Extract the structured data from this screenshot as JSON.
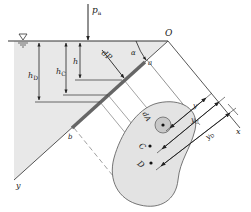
{
  "diagram": {
    "type": "hydrostatic-pressure-on-inclined-plane",
    "labels": {
      "atm_pressure": "p",
      "atm_pressure_sub": "a",
      "origin": "O",
      "angle": "α",
      "point_a": "a",
      "point_b": "b",
      "force_element": "dP",
      "depth_h": "h",
      "depth_hC": "h",
      "depth_hC_sub": "C",
      "depth_hD": "h",
      "depth_hD_sub": "D",
      "axis_x": "x",
      "axis_y": "y",
      "area_element": "dA",
      "centroid": "C",
      "pressure_center": "D",
      "dist_y": "y",
      "dist_yC": "y",
      "dist_yC_sub": "C",
      "dist_yD": "y",
      "dist_yD_sub": "D"
    },
    "colors": {
      "water_fill": "#e6e6e6",
      "plate_fill": "#e3e3e3",
      "plate_edge": "#555555",
      "line": "#333333",
      "thick_plate": "#666666",
      "dA_fill": "#c8c8c8"
    }
  }
}
